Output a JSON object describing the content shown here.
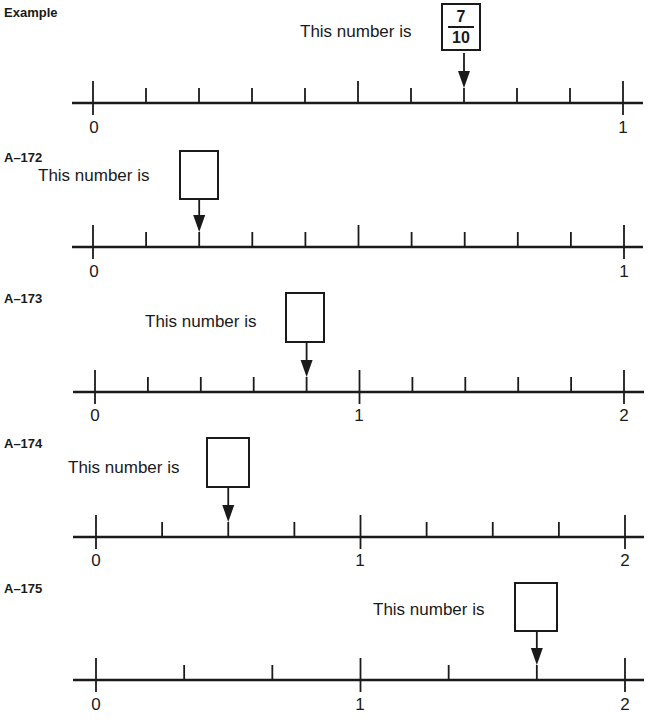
{
  "problems": [
    {
      "id": "example",
      "label": "Example",
      "prompt": "This number is",
      "answer": {
        "numerator": "7",
        "denominator": "10",
        "filled": true
      },
      "number_line": {
        "min": 0,
        "max": 1,
        "divisions": 10,
        "arrow_at_index": 7,
        "end_labels": [
          "0",
          "1"
        ],
        "long_tick_indices": [
          0,
          5,
          10
        ]
      }
    },
    {
      "id": "A-172",
      "label": "A–172",
      "prompt": "This number is",
      "answer": {
        "filled": false
      },
      "number_line": {
        "min": 0,
        "max": 1,
        "divisions": 10,
        "arrow_at_index": 2,
        "end_labels": [
          "0",
          "1"
        ],
        "long_tick_indices": [
          0,
          5,
          10
        ]
      }
    },
    {
      "id": "A-173",
      "label": "A–173",
      "prompt": "This number is",
      "answer": {
        "filled": false
      },
      "number_line": {
        "min": 0,
        "max": 2,
        "divisions": 10,
        "arrow_at_index": 4,
        "end_labels": [
          "0",
          "1",
          "2"
        ],
        "long_tick_indices": [
          0,
          5,
          10
        ]
      }
    },
    {
      "id": "A-174",
      "label": "A–174",
      "prompt": "This number is",
      "answer": {
        "filled": false
      },
      "number_line": {
        "min": 0,
        "max": 2,
        "divisions": 8,
        "arrow_at_index": 2,
        "end_labels": [
          "0",
          "1",
          "2"
        ],
        "long_tick_indices": [
          0,
          4,
          8
        ]
      }
    },
    {
      "id": "A-175",
      "label": "A–175",
      "prompt": "This number is",
      "answer": {
        "filled": false
      },
      "number_line": {
        "min": 0,
        "max": 2,
        "divisions": 6,
        "arrow_at_index": 5,
        "end_labels": [
          "0",
          "1",
          "2"
        ],
        "long_tick_indices": [
          0,
          3,
          6
        ]
      }
    }
  ]
}
